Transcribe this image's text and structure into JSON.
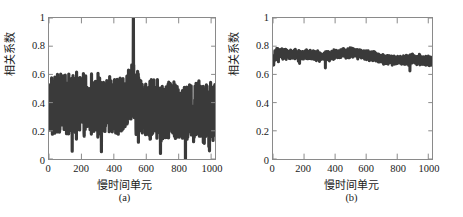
{
  "figure": {
    "background": "#ffffff",
    "trace_color": "#3a3a3a",
    "axis_color": "#8a8a8a"
  },
  "panels": [
    {
      "id": "a",
      "caption": "(a)",
      "xlabel": "慢时间单元",
      "ylabel": "相关系数",
      "xticks": [
        "0",
        "200",
        "400",
        "600",
        "800",
        "1000"
      ],
      "yticks": [
        "1",
        "0.8",
        "0.6",
        "0.4",
        "0.2",
        "0"
      ]
    },
    {
      "id": "b",
      "caption": "(b)",
      "xlabel": "慢时间单元",
      "ylabel": "相关系数",
      "xticks": [
        "0",
        "200",
        "400",
        "600",
        "800",
        "1000"
      ],
      "yticks": [
        "1",
        "0.8",
        "0.6",
        "0.4",
        "0.2",
        "0"
      ]
    }
  ],
  "chart_data": [
    {
      "type": "line",
      "panel": "a",
      "title": "",
      "xlabel": "慢时间单元",
      "ylabel": "相关系数",
      "xlim": [
        0,
        1024
      ],
      "ylim": [
        0,
        1
      ],
      "xticks": [
        0,
        200,
        400,
        600,
        800,
        1000
      ],
      "yticks": [
        0,
        0.2,
        0.4,
        0.6,
        0.8,
        1
      ],
      "grid": false,
      "legend": null,
      "annotations": [
        {
          "text": "peak",
          "x": 520,
          "y": 1.0
        }
      ],
      "series": [
        {
          "name": "correlation coefficient (unfocused)",
          "mean": 0.38,
          "min": 0.08,
          "max": 1.0,
          "noise_amplitude": 0.15,
          "peak_x": 520,
          "peak_value": 1.0,
          "n_points": 1024,
          "description": "Dense high-variance oscillation centered near 0.38, spanning roughly 0.10 to 0.62, with a single sharp spike reaching 1.0 at slow-time unit 520."
        }
      ]
    },
    {
      "type": "line",
      "panel": "b",
      "title": "",
      "xlabel": "慢时间单元",
      "ylabel": "相关系数",
      "xlim": [
        0,
        1024
      ],
      "ylim": [
        0,
        1
      ],
      "xticks": [
        0,
        200,
        400,
        600,
        800,
        1000
      ],
      "yticks": [
        0,
        0.2,
        0.4,
        0.6,
        0.8,
        1
      ],
      "grid": false,
      "legend": null,
      "annotations": [],
      "series": [
        {
          "name": "correlation coefficient (focused)",
          "mean": 0.72,
          "min": 0.6,
          "max": 0.81,
          "noise_amplitude": 0.04,
          "n_points": 1024,
          "description": "Tight low-variance noisy band centered near 0.72, spanning roughly 0.62 to 0.80, slightly higher near slow-time unit 300 and decaying toward 0.68 after 850."
        }
      ]
    }
  ]
}
